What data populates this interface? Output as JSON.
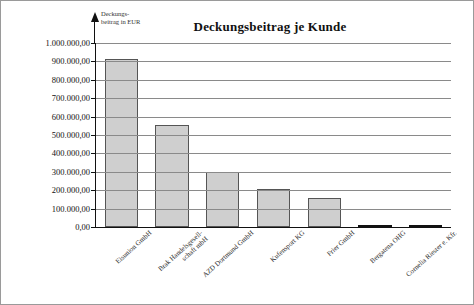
{
  "chart_data": {
    "type": "bar",
    "title": "Deckungsbeitrag je Kunde",
    "xlabel": "",
    "ylabel": "Deckungsbeitrag in EUR",
    "ylabel_line1": "Deckungs-",
    "ylabel_line2": "beitrag in EUR",
    "ylim": [
      0,
      1000000
    ],
    "grid": true,
    "legend": "none",
    "categories": [
      "Eisunion GmbH",
      "Brak Handelsgesell-\nschaft mbH",
      "AZD Dortmund GmbH",
      "Kufensport KG",
      "Frier GmbH",
      "Bergatena OHG",
      "Cornelia Riester e. Kfr."
    ],
    "category_lines": [
      [
        "Eisunion GmbH"
      ],
      [
        "Brak Handelsgesell-",
        "schaft mbH"
      ],
      [
        "AZD Dortmund GmbH"
      ],
      [
        "Kufensport KG"
      ],
      [
        "Frier GmbH"
      ],
      [
        "Bergatena OHG"
      ],
      [
        "Cornelia Riester e. Kfr."
      ]
    ],
    "values": [
      915000,
      555000,
      300000,
      205000,
      155000,
      8000,
      6000
    ],
    "ytick_values": [
      0,
      100000,
      200000,
      300000,
      400000,
      500000,
      600000,
      700000,
      800000,
      900000,
      1000000
    ],
    "ytick_labels": [
      "0,00",
      "100.000,00",
      "200.000,00",
      "300.000,00",
      "400.000,00",
      "500.000,00",
      "600.000,00",
      "700.000,00",
      "800.000,00",
      "900.000,00",
      "1.000.000,00"
    ],
    "colors": {
      "bar_fill": "#cfcfcf",
      "bar_stroke": "#555555",
      "gridline": "#8a8a8a",
      "axis": "#111111",
      "text": "#111111",
      "background": "#ffffff"
    }
  }
}
